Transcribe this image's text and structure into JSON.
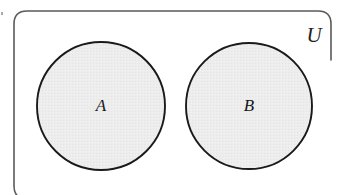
{
  "diagram": {
    "type": "venn-diagram",
    "universe": {
      "label": "U",
      "shape": "rounded-rectangle",
      "label_position": "top-right",
      "border_color": "#555555",
      "fill_color": "#ffffff"
    },
    "sets": [
      {
        "label": "A",
        "shape": "circle",
        "cx": 101,
        "cy": 106,
        "r": 64,
        "fill_color": "#ededed",
        "stroke_color": "#1a1a1a"
      },
      {
        "label": "B",
        "shape": "circle",
        "cx": 249,
        "cy": 106,
        "r": 63,
        "fill_color": "#ededed",
        "stroke_color": "#1a1a1a"
      }
    ],
    "background_color": "#ffffff"
  }
}
